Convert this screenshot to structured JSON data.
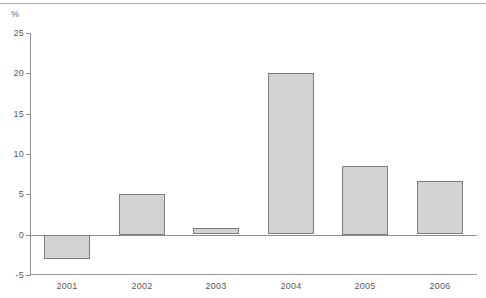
{
  "chart_data": {
    "type": "bar",
    "title": "",
    "subtitle": "",
    "xlabel": "",
    "ylabel": "%",
    "unit_label": "%",
    "categories": [
      "2001",
      "2002",
      "2003",
      "2004",
      "2005",
      "2006"
    ],
    "values": [
      -3.0,
      5.1,
      0.8,
      20.0,
      8.5,
      6.6
    ],
    "series": [
      {
        "name": "",
        "values": [
          -3.0,
          5.1,
          0.8,
          20.0,
          8.5,
          6.6
        ]
      }
    ],
    "ylim": [
      -5,
      25
    ],
    "yticks": [
      25,
      20,
      15,
      10,
      5,
      0,
      -5
    ],
    "ytick_labels": [
      "25",
      "20",
      "15",
      "10",
      "5",
      "0",
      "-5"
    ],
    "grid": false,
    "legend": null,
    "legend_position": "none",
    "annotations": [],
    "bar_fill_color": "#d3d3d3",
    "bar_border_color": "#7d7d7d",
    "axis_color": "#8f8f8f",
    "text_color": "#595959"
  }
}
